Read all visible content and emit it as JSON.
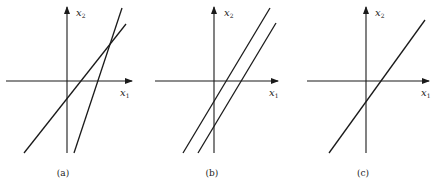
{
  "figure": {
    "panels": [
      {
        "id": "a",
        "caption": "(a)",
        "x_axis_label": "x",
        "x_axis_sub": "1",
        "y_axis_label": "x",
        "y_axis_sub": "2",
        "description": "Two intersecting lines (unique solution)",
        "lines": 2
      },
      {
        "id": "b",
        "caption": "(b)",
        "x_axis_label": "x",
        "x_axis_sub": "1",
        "y_axis_label": "x",
        "y_axis_sub": "2",
        "description": "Two parallel lines (no solution)",
        "lines": 2
      },
      {
        "id": "c",
        "caption": "(c)",
        "x_axis_label": "x",
        "x_axis_sub": "1",
        "y_axis_label": "x",
        "y_axis_sub": "2",
        "description": "Coincident lines (infinitely many solutions)",
        "lines": 1
      }
    ],
    "colors": {
      "stroke": "#1a1a1a",
      "background": "#ffffff"
    }
  }
}
